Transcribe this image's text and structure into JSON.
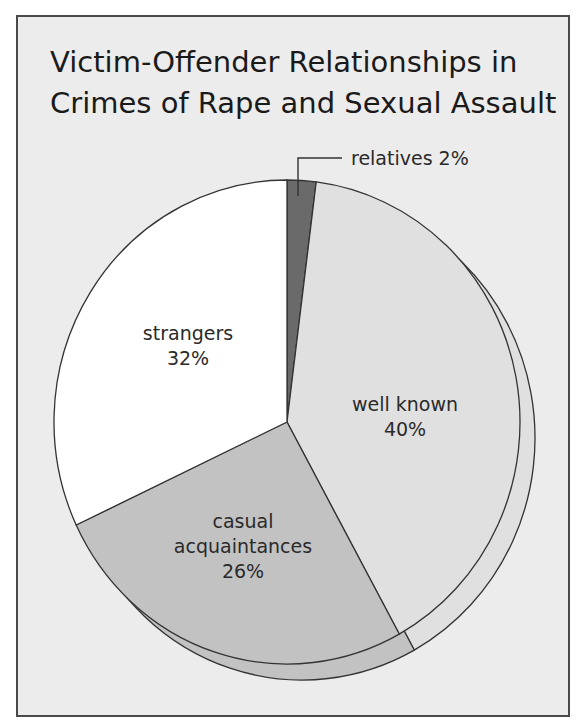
{
  "title": {
    "line1": "Victim-Offender Relationships in",
    "line2": "Crimes of Rape and Sexual Assault"
  },
  "colors": {
    "background": "#ececec",
    "frame_border": "#4a4a4a",
    "stroke": "#333333",
    "relatives": "#6a6a6a",
    "well_known": "#e0e0e0",
    "casual": "#c2c2c2",
    "strangers": "#ffffff"
  },
  "labels": {
    "relatives": "relatives 2%",
    "well_known_name": "well known",
    "well_known_pct": "40%",
    "casual_name1": "casual",
    "casual_name2": "acquaintances",
    "casual_pct": "26%",
    "strangers_name": "strangers",
    "strangers_pct": "32%"
  },
  "chart_data": {
    "type": "pie",
    "title": "Victim-Offender Relationships in Crimes of Rape and Sexual Assault",
    "categories": [
      "relatives",
      "well known",
      "casual acquaintances",
      "strangers"
    ],
    "values": [
      2,
      40,
      26,
      32
    ],
    "unit": "%",
    "start_angle": "12 o'clock",
    "direction": "clockwise",
    "style": "3D extruded pie (offset depth)",
    "legend": "none (direct labels)"
  }
}
